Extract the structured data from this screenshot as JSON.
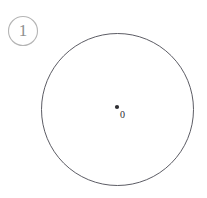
{
  "figure": {
    "background_color": "#ffffff",
    "width": 207,
    "height": 198,
    "badge": {
      "label": "1",
      "cx": 23,
      "cy": 31,
      "r": 14.5,
      "stroke_color": "#b5b5b5",
      "text_color": "#8f8f8f"
    },
    "main_circle": {
      "name": "circle-outline",
      "cx": 117.5,
      "cy": 109.5,
      "r": 76,
      "stroke_color": "#4a4a52",
      "fill": "none"
    },
    "center_point": {
      "label": "0",
      "cx": 117,
      "cy": 107,
      "r": 2.1,
      "color": "#2e2e33",
      "label_x": 120,
      "label_y": 118,
      "label_color": "#2b2b30"
    }
  },
  "chart_data": {
    "type": "diagram",
    "title": "",
    "shapes": [
      {
        "kind": "circle",
        "name": "main-circle",
        "center": [
          117.5,
          109.5
        ],
        "radius": 76,
        "stroke": "#4a4a52",
        "fill": "none"
      },
      {
        "kind": "point",
        "name": "center-point",
        "position": [
          117,
          107
        ],
        "label": "0",
        "color": "#2e2e33"
      },
      {
        "kind": "circle",
        "name": "figure-number-badge",
        "center": [
          23,
          31
        ],
        "radius": 14.5,
        "stroke": "#b5b5b5",
        "fill": "none",
        "label": "1"
      }
    ],
    "labels": [
      "1",
      "0"
    ],
    "grid": false,
    "legend": null
  }
}
